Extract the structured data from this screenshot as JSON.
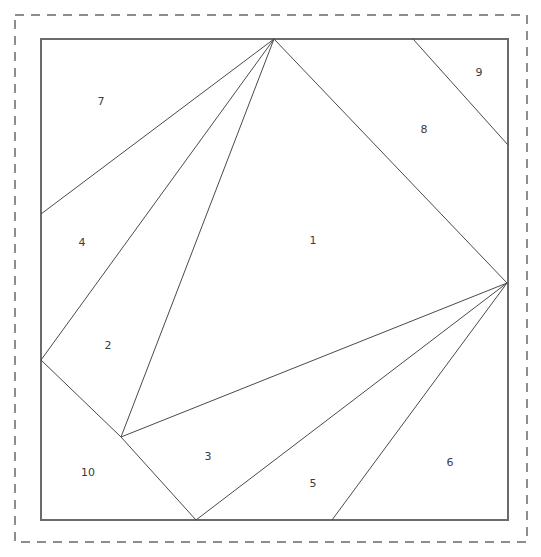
{
  "figure": {
    "width": 541,
    "height": 557,
    "background_color": "#ffffff"
  },
  "chart_data": {
    "type": "diagram",
    "xlabel": "",
    "ylabel": "",
    "grid": false,
    "legend": "none",
    "xlim": [
      0,
      541
    ],
    "ylim": [
      0,
      557
    ],
    "outer_dashed_frame": {
      "name": "dashed-bounding-box",
      "color": "#8d8d8d",
      "dash_pattern": "9 7",
      "x": 15,
      "y": 15,
      "width": 512,
      "height": 527
    },
    "square_boundary": {
      "name": "solid-square",
      "color": "#6b6b6b",
      "x": 41,
      "y": 39,
      "width": 467,
      "height": 481
    },
    "vertices": {
      "apex_top": [
        274,
        39
      ],
      "right_hub": [
        507,
        283
      ],
      "left_edge_mid": [
        41,
        360
      ],
      "left_edge_upper": [
        41,
        214
      ],
      "interior_low": [
        121,
        437
      ],
      "bottom_left_v": [
        196,
        520
      ],
      "bottom_mid_v": [
        332,
        520
      ],
      "top_edge_right": [
        413,
        39
      ],
      "right_edge_upper": [
        508,
        145
      ],
      "corner_tl": [
        41,
        39
      ],
      "corner_tr": [
        508,
        39
      ],
      "corner_br": [
        508,
        520
      ],
      "corner_bl": [
        41,
        520
      ]
    },
    "segments": [
      {
        "name": "apex-to-left-edge-upper",
        "from": [
          274,
          39
        ],
        "to": [
          41,
          214
        ]
      },
      {
        "name": "apex-to-left-edge-mid",
        "from": [
          274,
          39
        ],
        "to": [
          41,
          360
        ]
      },
      {
        "name": "apex-to-interior-low",
        "from": [
          274,
          39
        ],
        "to": [
          121,
          437
        ]
      },
      {
        "name": "apex-to-right-hub",
        "from": [
          274,
          39
        ],
        "to": [
          507,
          283
        ]
      },
      {
        "name": "top-edge-to-right-edge-upper",
        "from": [
          413,
          39
        ],
        "to": [
          508,
          145
        ]
      },
      {
        "name": "right-hub-to-interior-low",
        "from": [
          507,
          283
        ],
        "to": [
          121,
          437
        ]
      },
      {
        "name": "right-hub-to-bottom-left-v",
        "from": [
          507,
          283
        ],
        "to": [
          196,
          520
        ]
      },
      {
        "name": "right-hub-to-bottom-mid-v",
        "from": [
          507,
          283
        ],
        "to": [
          332,
          520
        ]
      },
      {
        "name": "left-edge-mid-to-interior-low",
        "from": [
          41,
          360
        ],
        "to": [
          121,
          437
        ]
      },
      {
        "name": "interior-low-to-bottom-left-v",
        "from": [
          121,
          437
        ],
        "to": [
          196,
          520
        ]
      }
    ],
    "region_labels": [
      {
        "label": "1",
        "x": 313,
        "y": 241
      },
      {
        "label": "2",
        "x": 108,
        "y": 346
      },
      {
        "label": "3",
        "x": 208,
        "y": 457
      },
      {
        "label": "4",
        "x": 82,
        "y": 243
      },
      {
        "label": "5",
        "x": 313,
        "y": 484
      },
      {
        "label": "6",
        "x": 450,
        "y": 463
      },
      {
        "label": "7",
        "x": 101,
        "y": 102
      },
      {
        "label": "8",
        "x": 424,
        "y": 130
      },
      {
        "label": "9",
        "x": 479,
        "y": 73
      },
      {
        "label": "10",
        "x": 88,
        "y": 473
      }
    ],
    "line_color": "#4a4a4a",
    "label_color": "#3b3b3b"
  }
}
